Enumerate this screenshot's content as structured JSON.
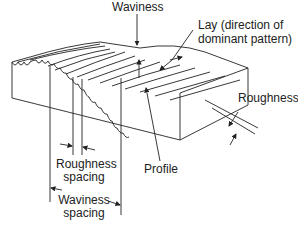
{
  "diagram": {
    "labels": {
      "waviness": "Waviness",
      "lay_line1": "Lay (direction of",
      "lay_line2": "dominant pattern)",
      "roughness": "Roughness",
      "roughness_spacing_line1": "Roughness",
      "roughness_spacing_line2": "spacing",
      "profile": "Profile",
      "waviness_spacing_line1": "Waviness",
      "waviness_spacing_line2": "spacing"
    },
    "colors": {
      "line": "#222222",
      "background": "#ffffff"
    }
  }
}
